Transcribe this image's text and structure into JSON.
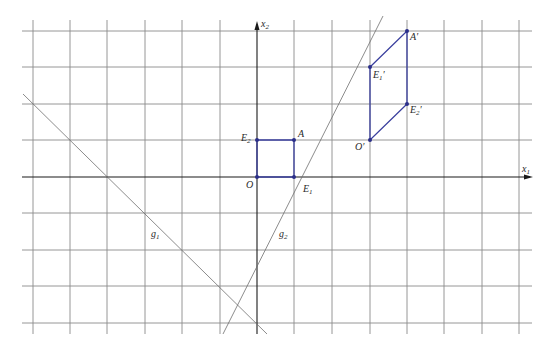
{
  "diagram": {
    "type": "coordinate-plane-linear-map",
    "axes": {
      "x_label": "x",
      "x_sub": "1",
      "y_label": "x",
      "y_sub": "2"
    },
    "grid": {
      "x_range": [
        -6,
        7
      ],
      "y_range": [
        -4,
        4
      ],
      "origin_px": [
        257,
        177
      ],
      "unit_px": 37.3
    },
    "original_square": {
      "points": [
        {
          "name": "O",
          "sub": "",
          "prime": "",
          "coords": [
            0,
            0
          ]
        },
        {
          "name": "E",
          "sub": "1",
          "prime": "",
          "coords": [
            1,
            0
          ]
        },
        {
          "name": "A",
          "sub": "",
          "prime": "",
          "coords": [
            1,
            1
          ]
        },
        {
          "name": "E",
          "sub": "2",
          "prime": "",
          "coords": [
            0,
            1
          ]
        }
      ],
      "color": "#3a3f9e"
    },
    "image_parallelogram": {
      "points": [
        {
          "name": "O",
          "sub": "",
          "prime": "′",
          "coords": [
            3,
            1
          ]
        },
        {
          "name": "E",
          "sub": "1",
          "prime": "′",
          "coords": [
            3,
            3
          ]
        },
        {
          "name": "A",
          "sub": "",
          "prime": "′",
          "coords": [
            4,
            4
          ]
        },
        {
          "name": "E",
          "sub": "2",
          "prime": "′",
          "coords": [
            4,
            2
          ]
        }
      ],
      "color": "#3a3f9e"
    },
    "lines": [
      {
        "name": "g",
        "sub": "1",
        "description": "line with slope -1 through (-6,2) and (0,-4)"
      },
      {
        "name": "g",
        "sub": "2",
        "description": "line with slope 2 through (1,0) and (0,-2)"
      }
    ]
  },
  "labels": {
    "x1": "x",
    "x1_sub": "1",
    "x2": "x",
    "x2_sub": "2",
    "O": "O",
    "E1": "E",
    "E1_sub": "1",
    "E2": "E",
    "E2_sub": "2",
    "A": "A",
    "O_prime": "O′",
    "E1_prime": "E",
    "E1_prime_sub": "1",
    "E1_prime_mark": "′",
    "E2_prime": "E",
    "E2_prime_sub": "2",
    "E2_prime_mark": "′",
    "A_prime": "A′",
    "g1": "g",
    "g1_sub": "1",
    "g2": "g",
    "g2_sub": "2"
  }
}
